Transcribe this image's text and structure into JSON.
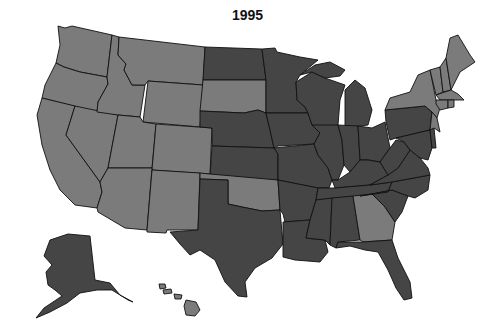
{
  "title": "1995",
  "colors": {
    "category_light": "#7b7b7b",
    "category_dark": "#454545",
    "border": "#111111",
    "background": "#ffffff"
  },
  "legend": [],
  "states": {
    "light": [
      "WA",
      "OR",
      "CA",
      "NV",
      "ID",
      "MT",
      "WY",
      "UT",
      "AZ",
      "CO",
      "NM",
      "SD",
      "OK",
      "GA",
      "NY",
      "VT",
      "NH",
      "ME",
      "MA",
      "RI",
      "CT",
      "NJ",
      "HI"
    ],
    "dark": [
      "ND",
      "MN",
      "WI",
      "MI",
      "NE",
      "KS",
      "IA",
      "IL",
      "IN",
      "OH",
      "MO",
      "AR",
      "TX",
      "LA",
      "MS",
      "AL",
      "TN",
      "KY",
      "WV",
      "VA",
      "NC",
      "SC",
      "FL",
      "PA",
      "MD",
      "DE",
      "AK"
    ]
  }
}
